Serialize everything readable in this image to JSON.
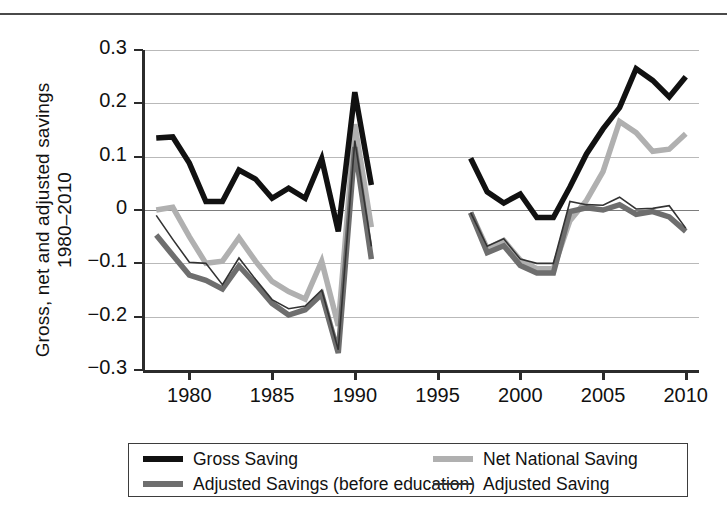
{
  "figure": {
    "ylabel": "Gross, net and adjusted savings\n1980–2010",
    "top_rule": "horizontal-rule"
  },
  "axes": {
    "y_ticks": [
      "0.3",
      "0.2",
      "0.1",
      "0",
      "−0.1",
      "−0.2",
      "−0.3"
    ],
    "x_ticks": [
      "1980",
      "1985",
      "1990",
      "1995",
      "2000",
      "2005",
      "2010"
    ]
  },
  "legend": {
    "entries": [
      {
        "label": "Gross Saving",
        "color": "#111111",
        "width": 5.5
      },
      {
        "label": "Net National Saving",
        "color": "#b0b0b0",
        "width": 5.5
      },
      {
        "label": "Adjusted Savings (before education)",
        "color": "#6e6e6e",
        "width": 5.5
      },
      {
        "label": "Adjusted Saving",
        "color": "#333333",
        "width": 1.6
      }
    ]
  },
  "chart_data": {
    "type": "line",
    "title": "",
    "xlabel": "",
    "ylabel": "Gross, net and adjusted savings 1980–2010",
    "xlim": [
      1977.2,
      2010.8
    ],
    "ylim": [
      -0.3,
      0.3
    ],
    "grid": true,
    "legend_position": "below-axes",
    "x_ticks": [
      1980,
      1985,
      1990,
      1995,
      2000,
      2005,
      2010
    ],
    "y_ticks": [
      0.3,
      0.2,
      0.1,
      0,
      -0.1,
      -0.2,
      -0.3
    ],
    "note": "Data are split into two segments with a gap from 1992 to 1996 inclusive.",
    "series": [
      {
        "name": "Gross Saving",
        "color": "#111111",
        "segments": [
          {
            "x": [
              1978,
              1979,
              1980,
              1981,
              1982,
              1983,
              1984,
              1985,
              1986,
              1987,
              1988,
              1989,
              1990,
              1991
            ],
            "y": [
              0.135,
              0.137,
              0.088,
              0.016,
              0.016,
              0.075,
              0.058,
              0.022,
              0.041,
              0.022,
              0.096,
              -0.04,
              0.221,
              0.047
            ]
          },
          {
            "x": [
              1997,
              1998,
              1999,
              2000,
              2001,
              2002,
              2003,
              2004,
              2005,
              2006,
              2007,
              2008,
              2009,
              2010
            ],
            "y": [
              0.097,
              0.034,
              0.013,
              0.03,
              -0.014,
              -0.014,
              0.043,
              0.105,
              0.152,
              0.192,
              0.265,
              0.243,
              0.212,
              0.25
            ]
          }
        ]
      },
      {
        "name": "Net National Saving",
        "color": "#b0b0b0",
        "segments": [
          {
            "x": [
              1978,
              1979,
              1980,
              1981,
              1982,
              1983,
              1984,
              1985,
              1986,
              1987,
              1988,
              1989,
              1990,
              1991
            ],
            "y": [
              0.0,
              0.005,
              -0.05,
              -0.1,
              -0.096,
              -0.052,
              -0.096,
              -0.134,
              -0.153,
              -0.167,
              -0.096,
              -0.217,
              0.161,
              -0.032
            ]
          },
          {
            "x": [
              1997,
              1998,
              1999,
              2000,
              2001,
              2002,
              2003,
              2004,
              2005,
              2006,
              2007,
              2008,
              2009,
              2010
            ],
            "y": [
              -0.005,
              -0.072,
              -0.057,
              -0.094,
              -0.11,
              -0.11,
              -0.02,
              0.018,
              0.072,
              0.166,
              0.145,
              0.11,
              0.114,
              0.143
            ]
          }
        ]
      },
      {
        "name": "Adjusted Savings (before education)",
        "color": "#6e6e6e",
        "segments": [
          {
            "x": [
              1978,
              1979,
              1980,
              1981,
              1982,
              1983,
              1984,
              1985,
              1986,
              1987,
              1988,
              1989,
              1990,
              1991
            ],
            "y": [
              -0.047,
              -0.085,
              -0.122,
              -0.132,
              -0.148,
              -0.105,
              -0.139,
              -0.175,
              -0.197,
              -0.187,
              -0.158,
              -0.268,
              0.118,
              -0.092
            ]
          },
          {
            "x": [
              1997,
              1998,
              1999,
              2000,
              2001,
              2002,
              2003,
              2004,
              2005,
              2006,
              2007,
              2008,
              2009,
              2010
            ],
            "y": [
              -0.005,
              -0.08,
              -0.067,
              -0.104,
              -0.118,
              -0.118,
              -0.003,
              0.004,
              0.0,
              0.01,
              -0.008,
              -0.003,
              -0.013,
              -0.04
            ]
          }
        ]
      },
      {
        "name": "Adjusted Saving",
        "color": "#333333",
        "segments": [
          {
            "x": [
              1978,
              1979,
              1980,
              1981,
              1982,
              1983,
              1984,
              1985,
              1986,
              1987,
              1988,
              1989,
              1990,
              1991
            ],
            "y": [
              -0.01,
              -0.055,
              -0.098,
              -0.1,
              -0.14,
              -0.09,
              -0.13,
              -0.168,
              -0.185,
              -0.18,
              -0.15,
              -0.262,
              0.13,
              -0.068
            ]
          },
          {
            "x": [
              1997,
              1998,
              1999,
              2000,
              2001,
              2002,
              2003,
              2004,
              2005,
              2006,
              2007,
              2008,
              2009,
              2010
            ],
            "y": [
              -0.005,
              -0.068,
              -0.054,
              -0.092,
              -0.1,
              -0.1,
              0.016,
              0.01,
              0.009,
              0.024,
              0.002,
              0.003,
              0.008,
              -0.034
            ]
          }
        ]
      }
    ]
  }
}
